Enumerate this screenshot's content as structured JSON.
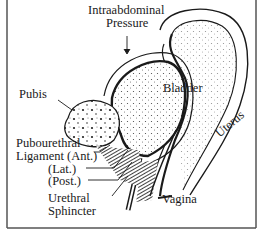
{
  "diagram": {
    "labels": {
      "intraabdominal_line1": "Intraabdominal",
      "intraabdominal_line2": "Pressure",
      "bladder": "Bladder",
      "pubis": "Pubis",
      "pubourethral_line1": "Pubourethral",
      "pubourethral_line2": "Ligament (Ant.)",
      "lat": "(Lat.)",
      "post": "(Post.)",
      "urethral_line1": "Urethral",
      "urethral_line2": "Sphincter",
      "vagina": "Vagina",
      "uterus": "Uterus"
    },
    "colors": {
      "ink": "#1a1a1a",
      "frame": "#555555",
      "background": "#ffffff"
    }
  }
}
